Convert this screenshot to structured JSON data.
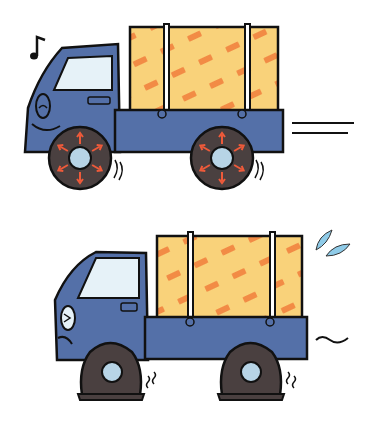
{
  "illustration": {
    "description": "Two cartoon trucks: top happy truck with inflated tires driving fast, bottom sad truck with flat tires",
    "colors": {
      "body": "#5470a8",
      "cargo": "#f9d27a",
      "cargo_pattern": "#f28b45",
      "tire": "#4a4040",
      "hub": "#b7d4e6",
      "window": "#e6f2f8",
      "outline": "#111111",
      "arrow": "#ee5a3a",
      "sweat": "#8fcbe8"
    },
    "top_truck": {
      "mood": "happy",
      "tires": "inflated",
      "symbol": "music-note"
    },
    "bottom_truck": {
      "mood": "sad",
      "tires": "flat",
      "symbol": "sweat-drops"
    }
  }
}
